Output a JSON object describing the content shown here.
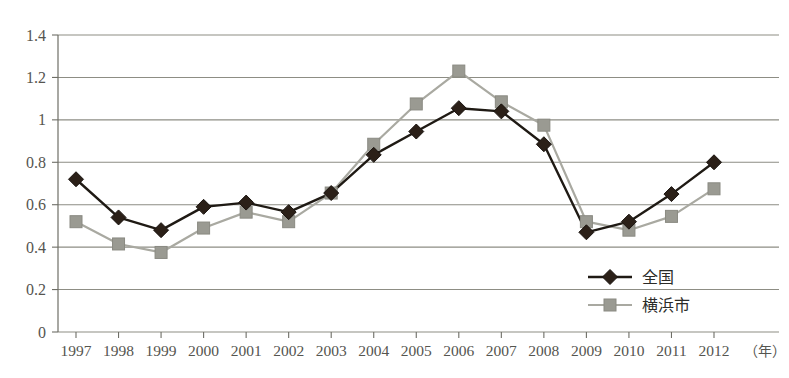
{
  "chart_data": {
    "type": "line",
    "title": "",
    "xlabel": "（年）",
    "ylabel": "",
    "ylim": [
      0,
      1.4
    ],
    "ytick_step": 0.2,
    "grid": true,
    "legend_position": "bottom-right",
    "categories": [
      "1997",
      "1998",
      "1999",
      "2000",
      "2001",
      "2002",
      "2003",
      "2004",
      "2005",
      "2006",
      "2007",
      "2008",
      "2009",
      "2010",
      "2011",
      "2012"
    ],
    "yticks": [
      "0",
      "0.2",
      "0.4",
      "0.6",
      "0.8",
      "1",
      "1.2",
      "1.4"
    ],
    "series": [
      {
        "name": "全国",
        "marker": "diamond",
        "color": "#2b2018",
        "line_color": "#1f1a14",
        "values": [
          0.72,
          0.54,
          0.48,
          0.59,
          0.61,
          0.565,
          0.655,
          0.835,
          0.945,
          1.055,
          1.04,
          0.885,
          0.47,
          0.52,
          0.65,
          0.8
        ]
      },
      {
        "name": "横浜市",
        "marker": "square",
        "color": "#9a9a92",
        "line_color": "#a9a9a1",
        "values": [
          0.52,
          0.415,
          0.375,
          0.49,
          0.565,
          0.52,
          0.655,
          0.885,
          1.075,
          1.23,
          1.085,
          0.975,
          0.52,
          0.48,
          0.545,
          0.675
        ]
      }
    ]
  },
  "legend": {
    "items": [
      {
        "label": "全国",
        "marker": "diamond"
      },
      {
        "label": "横浜市",
        "marker": "square"
      }
    ]
  },
  "colors": {
    "series_national": "#2b2018",
    "series_yokohama": "#9a9a92",
    "gridline": "#8d8d84",
    "axis": "#6e6e66",
    "text": "#55554f",
    "background": "#ffffff"
  }
}
